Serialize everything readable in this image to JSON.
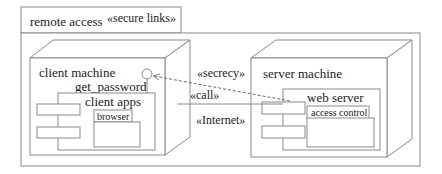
{
  "diagram": {
    "type": "UML deployment diagram",
    "package": {
      "name": "remote access",
      "stereotype": "«secure links»"
    },
    "nodes": [
      {
        "id": "client",
        "name": "client machine",
        "interface": "get_password",
        "component": {
          "name": "client apps",
          "subcomponent": "browser"
        }
      },
      {
        "id": "server",
        "name": "server machine",
        "component": {
          "name": "web server",
          "subcomponent": "access control"
        }
      }
    ],
    "links": {
      "dependency_stereotype": "«secrecy»",
      "dependency_label": "«call»",
      "communication_stereotype": "«Internet»"
    }
  }
}
